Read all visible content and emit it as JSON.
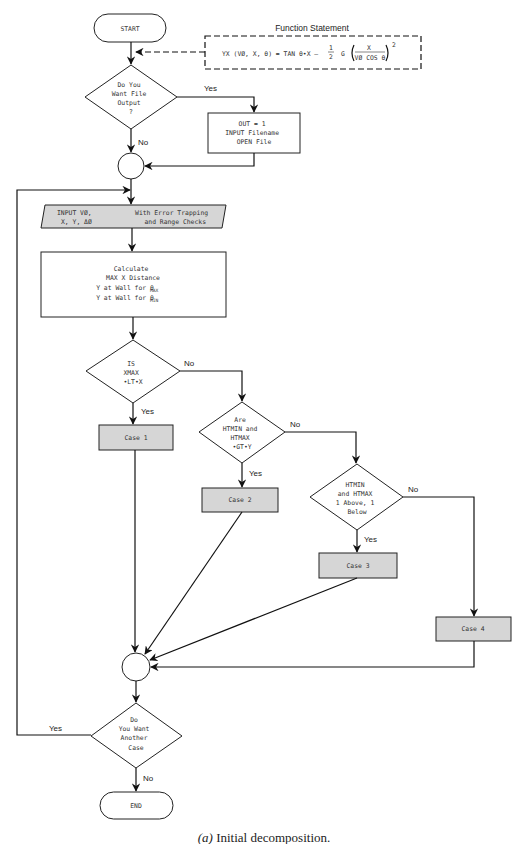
{
  "function_statement": {
    "title": "Function Statement",
    "lhs": "YX (VØ, X, θ) = TAN θ•X –",
    "half_num": "1",
    "half_den": "2",
    "g": "G",
    "frac_num": "X",
    "frac_den": "VØ COS θ",
    "exponent": "2"
  },
  "nodes": {
    "start": "START",
    "end": "END",
    "decision_file": [
      "Do You",
      "Want File",
      "Output",
      "?"
    ],
    "out_box": [
      "OUT = 1",
      "INPUT Filename",
      "OPEN File"
    ],
    "input_left": [
      "INPUT VØ,",
      "X, Y, ΔØ"
    ],
    "input_right": [
      "With Error Trapping",
      "and Range Checks"
    ],
    "calculate": [
      "Calculate",
      "MAX X Distance",
      "Y at Wall for θ",
      "Y at Wall for θ"
    ],
    "calc_subscripts": [
      "MAX",
      "MIN"
    ],
    "decision_xmax": [
      "IS",
      "XMAX",
      "•LT•X"
    ],
    "decision_htmin": [
      "Are",
      "HTMIN and",
      "HTMAX",
      "•GT•Y"
    ],
    "decision_above": [
      "HTMIN",
      "and HTMAX",
      "1 Above, 1",
      "Below"
    ],
    "decision_another": [
      "Do",
      "You Want",
      "Another",
      "Case"
    ],
    "case1": "Case 1",
    "case2": "Case 2",
    "case3": "Case 3",
    "case4": "Case 4"
  },
  "labels": {
    "file_yes": "Yes",
    "file_no": "No",
    "xmax_no": "No",
    "xmax_yes": "Yes",
    "htmin_no": "No",
    "htmin_yes": "Yes",
    "above_no": "No",
    "above_yes": "Yes",
    "another_yes": "Yes",
    "another_no": "No"
  },
  "caption": {
    "label": "(a)",
    "text": " Initial decomposition."
  },
  "colors": {
    "shaded_fill": "#d6d6d6",
    "stroke": "#222222"
  }
}
